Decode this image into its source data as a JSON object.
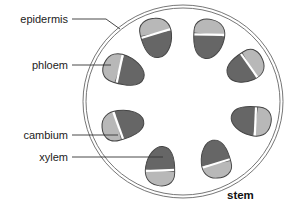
{
  "diagram": {
    "title": "stem",
    "labels": {
      "epidermis": "epidermis",
      "phloem": "phloem",
      "cambium": "cambium",
      "xylem": "xylem"
    },
    "colors": {
      "background": "#ffffff",
      "outline": "#555555",
      "phloem_fill": "#b8b8b8",
      "xylem_fill": "#666666",
      "cambium_fill": "#ffffff",
      "leader_line": "#333333"
    },
    "vascular_bundle_count": 8
  }
}
